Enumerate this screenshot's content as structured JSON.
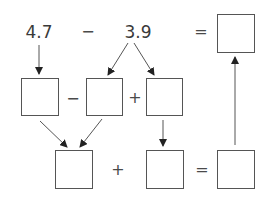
{
  "diagram": {
    "top_row": {
      "minuend": "4.7",
      "operator": "−",
      "subtrahend": "3.9",
      "equals": "=",
      "result_box": ""
    },
    "middle_row": {
      "box_a": "",
      "operator_1": "−",
      "box_b": "",
      "operator_2": "+",
      "box_c": ""
    },
    "bottom_row": {
      "box_d": "",
      "operator": "+",
      "box_e": "",
      "equals": "=",
      "box_f": ""
    },
    "arrows": [
      {
        "from": "4.7",
        "to": "box_a"
      },
      {
        "from": "3.9",
        "to": "box_b"
      },
      {
        "from": "3.9",
        "to": "box_c"
      },
      {
        "from": "box_a",
        "to": "box_d"
      },
      {
        "from": "box_b",
        "to": "box_d"
      },
      {
        "from": "box_c",
        "to": "box_e"
      },
      {
        "from": "box_f",
        "to": "result_box"
      }
    ],
    "colors": {
      "line": "#555555",
      "text": "#3a3a3a",
      "background": "#ffffff"
    }
  }
}
